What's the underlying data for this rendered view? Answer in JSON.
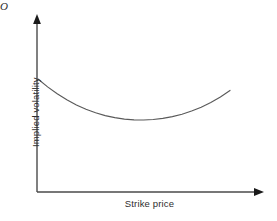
{
  "figure": {
    "background_color": "#ffffff",
    "width": 277,
    "height": 221,
    "origin_label": "O"
  },
  "chart_data": {
    "type": "line",
    "title": "",
    "subtitle": "",
    "xlabel": "Strike price",
    "ylabel": "Implied volatility",
    "annotations": [
      "O"
    ],
    "legend": [],
    "legend_position": "none",
    "grid": false,
    "axis_style": "arrow",
    "xlim": [
      0,
      1
    ],
    "ylim": [
      0,
      1
    ],
    "xticks": [],
    "yticks": [],
    "xticklabels": [],
    "yticklabels": [],
    "series": [
      {
        "name": "Volatility smile",
        "color": "#5a5a5a",
        "linewidth": 1.15,
        "x": [
          0.0,
          0.05,
          0.1,
          0.15,
          0.2,
          0.25,
          0.3,
          0.35,
          0.4,
          0.45,
          0.5,
          0.55,
          0.6,
          0.65,
          0.7,
          0.75,
          0.8,
          0.85,
          0.9,
          0.95,
          1.0
        ],
        "y": [
          1.0,
          0.868,
          0.752,
          0.652,
          0.566,
          0.494,
          0.435,
          0.389,
          0.354,
          0.33,
          0.317,
          0.315,
          0.323,
          0.342,
          0.371,
          0.412,
          0.464,
          0.529,
          0.608,
          0.7,
          0.809
        ],
        "shape": "convex-u",
        "minimum": {
          "x": 0.55,
          "y": 0.315
        }
      }
    ],
    "curve_pixels": {
      "start": [
        38,
        79
      ],
      "minimum": [
        133,
        120
      ],
      "end": [
        230,
        79
      ]
    },
    "axes_pixels": {
      "y_axis": {
        "x": 37,
        "y_top": 17,
        "y_bottom": 192
      },
      "x_axis": {
        "y": 192,
        "x_left": 37,
        "x_right": 262
      }
    },
    "colors": {
      "axis": "#4a4a4a",
      "arrow": "#1a1a1a",
      "curve": "#5a5a5a",
      "text": "#2e2e2e",
      "background": "#ffffff"
    }
  }
}
